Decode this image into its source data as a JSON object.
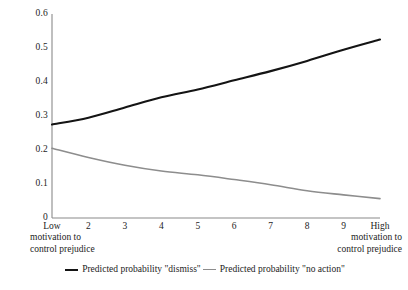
{
  "chart_data": {
    "type": "line",
    "title": "",
    "subtitle": "",
    "xlabel": "motivation to control prejudice",
    "ylabel": "",
    "categories": [
      "Low",
      "2",
      "3",
      "4",
      "5",
      "6",
      "7",
      "8",
      "9",
      "High"
    ],
    "x_tick_labels": [
      "Low",
      "2",
      "3",
      "4",
      "5",
      "6",
      "7",
      "8",
      "9",
      "High"
    ],
    "y_tick_labels": [
      "0.6",
      "0.5",
      "0.4",
      "0.3",
      "0.2",
      "0.1",
      "0"
    ],
    "y_tick_values": [
      0.6,
      0.5,
      0.4,
      0.3,
      0.2,
      0.1,
      0
    ],
    "ylim": [
      0,
      0.6
    ],
    "xlim": [
      1,
      10
    ],
    "grid": false,
    "legend_position": "bottom",
    "series": [
      {
        "name": "Predicted probability \"dismiss\"",
        "color": "#141414",
        "width": 2.1,
        "values": [
          0.275,
          0.295,
          0.325,
          0.355,
          0.378,
          0.405,
          0.432,
          0.462,
          0.495,
          0.525
        ]
      },
      {
        "name": "Predicted probability \"no action\"",
        "color": "#8d8d8d",
        "width": 1.6,
        "values": [
          0.205,
          0.178,
          0.155,
          0.138,
          0.127,
          0.113,
          0.098,
          0.08,
          0.068,
          0.057
        ]
      }
    ],
    "axis_captions": {
      "left": [
        "Low",
        "motivation to",
        "control prejudice"
      ],
      "right": [
        "High",
        "motivation to",
        "control prejudice"
      ]
    }
  },
  "axis_caption_left": {
    "line1": "motivation to",
    "line2": "control prejudice"
  },
  "axis_caption_right": {
    "line1": "motivation to",
    "line2": "control prejudice"
  },
  "legend": {
    "entries": [
      {
        "label": "Predicted probability \"dismiss\""
      },
      {
        "label": "Predicted probability \"no action\""
      }
    ]
  },
  "colors": {
    "series_dismiss": "#141414",
    "series_no_action": "#8d8d8d",
    "axis": "#8a8a8a",
    "text": "#1c1c1c",
    "background": "#ffffff"
  }
}
